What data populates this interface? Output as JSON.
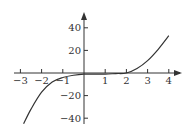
{
  "chart_data": {
    "type": "line",
    "title": "",
    "xlabel": "",
    "ylabel": "",
    "xlim": [
      -3,
      4
    ],
    "ylim": [
      -45,
      45
    ],
    "grid": false,
    "legend": null,
    "x_ticks": [
      -3,
      -2,
      -1,
      1,
      2,
      3,
      4
    ],
    "x_tick_labels": [
      "−3",
      "−2",
      "−1",
      "1",
      "2",
      "3",
      "4"
    ],
    "y_ticks": [
      40,
      20,
      -20,
      -40
    ],
    "y_tick_labels": [
      "40",
      "20",
      "−20",
      "−40"
    ],
    "series": [
      {
        "name": "f(x)",
        "x": [
          -2.85,
          -2.5,
          -2,
          -1.5,
          -1,
          -0.5,
          0,
          0.5,
          1,
          1.5,
          2,
          2.5,
          3,
          3.5,
          4
        ],
        "y": [
          -45,
          -32,
          -17,
          -8,
          -4,
          -2,
          -1,
          -1,
          -1,
          -0.5,
          0,
          4,
          11,
          21,
          33
        ]
      }
    ],
    "colors": {
      "curve": "#333333",
      "axis": "#333333"
    }
  }
}
